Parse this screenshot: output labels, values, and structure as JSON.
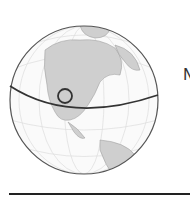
{
  "figure": {
    "label_partial": "N",
    "globe": {
      "region": "North America",
      "marker": {
        "type": "circle",
        "cx": 65,
        "cy": 96,
        "r": 7
      },
      "highlight_line": "latitude line"
    },
    "colors": {
      "ocean": "#ffffff",
      "land": "#cfcfcf",
      "outline": "#555555",
      "grid": "#dddddd",
      "line": "#333333"
    }
  }
}
